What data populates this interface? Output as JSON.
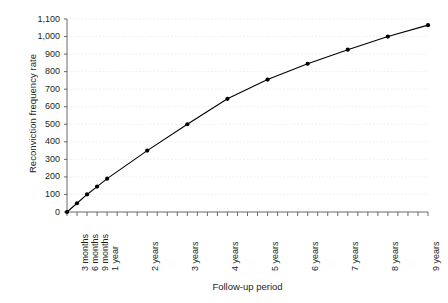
{
  "chart_data": {
    "type": "line",
    "title": "",
    "xlabel": "Follow-up period",
    "ylabel": "Reconviction frequency rate",
    "grid": true,
    "legend": false,
    "ylim": [
      0,
      1100
    ],
    "ytick_labels": [
      "0",
      "100",
      "200",
      "300",
      "400",
      "500",
      "600",
      "700",
      "800",
      "900",
      "1,000",
      "1,100"
    ],
    "ytick_values": [
      0,
      100,
      200,
      300,
      400,
      500,
      600,
      700,
      800,
      900,
      1000,
      1100
    ],
    "categories": [
      "3 months",
      "6 months",
      "9 months",
      "1 year",
      "2 years",
      "3 years",
      "4 years",
      "5 years",
      "6 years",
      "7 years",
      "8 years",
      "9 years"
    ],
    "x_positions_quarters": [
      1,
      2,
      3,
      4,
      8,
      12,
      16,
      20,
      24,
      28,
      32,
      36
    ],
    "x_range_quarters": [
      0,
      36
    ],
    "origin_point": {
      "x_quarters": 0,
      "value": 0
    },
    "values": [
      50,
      100,
      145,
      190,
      350,
      500,
      645,
      755,
      845,
      925,
      1000,
      1065
    ],
    "series": [
      {
        "name": "Reconviction frequency rate",
        "marker": "filled-circle",
        "color": "#000000",
        "points": [
          {
            "x_quarters": 0,
            "label": "",
            "value": 0
          },
          {
            "x_quarters": 1,
            "label": "3 months",
            "value": 50
          },
          {
            "x_quarters": 2,
            "label": "6 months",
            "value": 100
          },
          {
            "x_quarters": 3,
            "label": "9 months",
            "value": 145
          },
          {
            "x_quarters": 4,
            "label": "1 year",
            "value": 190
          },
          {
            "x_quarters": 8,
            "label": "2 years",
            "value": 350
          },
          {
            "x_quarters": 12,
            "label": "3 years",
            "value": 500
          },
          {
            "x_quarters": 16,
            "label": "4 years",
            "value": 645
          },
          {
            "x_quarters": 20,
            "label": "5 years",
            "value": 755
          },
          {
            "x_quarters": 24,
            "label": "6 years",
            "value": 845
          },
          {
            "x_quarters": 28,
            "label": "7 years",
            "value": 925
          },
          {
            "x_quarters": 32,
            "label": "8 years",
            "value": 1000
          },
          {
            "x_quarters": 36,
            "label": "9 years",
            "value": 1065
          }
        ]
      }
    ],
    "colors": {
      "line": "#000000",
      "marker": "#000000",
      "axis": "#58595b",
      "grid": "#e8e8e8",
      "text": "#231f20",
      "background": "#ffffff"
    }
  }
}
